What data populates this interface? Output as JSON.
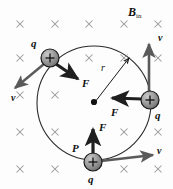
{
  "figure": {
    "title_label": "B",
    "field_label": {
      "symbol": "B",
      "subscript": "in",
      "meaning": "magnetic-field-into-page"
    },
    "canvas": {
      "width": 173,
      "height": 189,
      "background": "#fdfdfd"
    },
    "colors": {
      "stroke": "#1a1a1a",
      "arrow_dark": "#262626",
      "arrow_gray": "#5a5a5a",
      "charge_fill": "#8f8f8f",
      "charge_edge": "#1a1a1a",
      "field_mark": "#9a9a9a",
      "orbit": "#2b2b2b"
    },
    "orbit": {
      "center_x": 94,
      "center_y": 103,
      "radius": 57,
      "center_dot_label": "",
      "radius_label": "r",
      "radius_label_x": 104,
      "radius_label_y": 68
    },
    "field_marks": {
      "glyph": "×",
      "label": "into-page-cross",
      "positions": [
        [
          20,
          24
        ],
        [
          55,
          24
        ],
        [
          89,
          24
        ],
        [
          124,
          24
        ],
        [
          158,
          24
        ],
        [
          20,
          58
        ],
        [
          89,
          58
        ],
        [
          124,
          58
        ],
        [
          158,
          58
        ],
        [
          20,
          95
        ],
        [
          55,
          95
        ],
        [
          20,
          132
        ],
        [
          55,
          132
        ],
        [
          124,
          132
        ],
        [
          158,
          132
        ],
        [
          20,
          169
        ],
        [
          55,
          169
        ],
        [
          124,
          169
        ],
        [
          158,
          169
        ]
      ]
    },
    "charges": [
      {
        "name": "charge-upper-left",
        "sign": "+",
        "label": "q",
        "label_x": 33,
        "label_y": 46,
        "x": 50,
        "y": 58,
        "r": 9
      },
      {
        "name": "charge-right",
        "sign": "+",
        "label": "q",
        "label_x": 157,
        "label_y": 118,
        "x": 150,
        "y": 100,
        "r": 9
      },
      {
        "name": "charge-bottom-P",
        "sign": "+",
        "label": "q",
        "label_x": 89,
        "label_y": 185,
        "point_label": "P",
        "point_label_x": 74,
        "point_label_y": 153,
        "x": 93,
        "y": 162,
        "r": 9
      }
    ],
    "vectors": [
      {
        "name": "force-vector-upper-left",
        "label": "F",
        "label_x": 84,
        "label_y": 86,
        "from_x": 56,
        "from_y": 64,
        "to_x": 80,
        "to_y": 80,
        "style": "dark"
      },
      {
        "name": "velocity-vector-upper-left",
        "label": "v",
        "label_x": 13,
        "label_y": 102,
        "from_x": 44,
        "from_y": 64,
        "to_x": 13,
        "to_y": 90,
        "style": "gray"
      },
      {
        "name": "force-vector-right",
        "label": "F",
        "label_x": 113,
        "label_y": 116,
        "from_x": 142,
        "from_y": 99,
        "to_x": 110,
        "to_y": 98,
        "style": "dark"
      },
      {
        "name": "velocity-vector-right",
        "label": "v",
        "label_x": 160,
        "label_y": 45,
        "from_x": 149,
        "from_y": 92,
        "to_x": 149,
        "to_y": 42,
        "style": "gray"
      },
      {
        "name": "force-vector-bottom",
        "label": "F",
        "label_x": 101,
        "label_y": 131,
        "from_x": 93,
        "from_y": 154,
        "to_x": 93,
        "to_y": 127,
        "style": "dark"
      },
      {
        "name": "velocity-vector-bottom",
        "label": "v",
        "label_x": 159,
        "label_y": 157,
        "from_x": 101,
        "from_y": 161,
        "to_x": 155,
        "to_y": 155,
        "style": "gray"
      }
    ]
  }
}
